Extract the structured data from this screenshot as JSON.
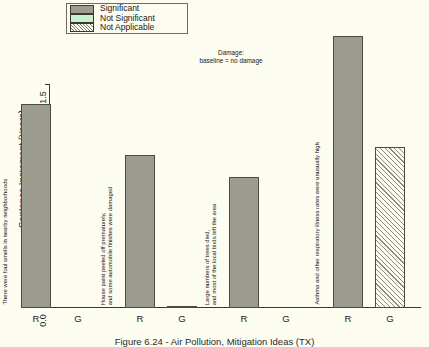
{
  "figure": {
    "caption": "Figure 6.24 - Air Pollution, Mitigation Ideas (TX)",
    "annotation_line1": "Damage:",
    "annotation_line2": "baseline = no damage"
  },
  "legend": {
    "items": [
      {
        "label": "Significant",
        "key": "significant",
        "color": "#9c9c90"
      },
      {
        "label": "Not Significant",
        "key": "notsignificant",
        "color": "#c9f0cf"
      },
      {
        "label": "Not Applicable",
        "key": "notapplicable",
        "color": "#fdfcf0"
      }
    ]
  },
  "chart_data": {
    "type": "bar",
    "title": "Figure 6.24 - Air Pollution, Mitigation Ideas (TX)",
    "xlabel": "",
    "ylabel": "Sentence Increment (Years)",
    "ylim": [
      0.0,
      1.6
    ],
    "yticks": [
      "0.0",
      "0.5",
      "1.0",
      "1.5"
    ],
    "ytick_values": [
      0.0,
      0.5,
      1.0,
      1.5
    ],
    "grid": false,
    "legend_position": "top-center",
    "categories": [
      "R",
      "G",
      "R",
      "G",
      "R",
      "G",
      "R",
      "G"
    ],
    "groups": [
      {
        "caption": "There were foul smells in nearby neighborhoods",
        "bars": [
          {
            "tick": "R",
            "value": 1.37,
            "significance": "significant"
          },
          {
            "tick": "G",
            "value": 0.0,
            "significance": "significant"
          }
        ]
      },
      {
        "caption": "House paint peeled off prematurely, and some automobile finishes were damaged",
        "bars": [
          {
            "tick": "R",
            "value": 1.03,
            "significance": "significant"
          },
          {
            "tick": "G",
            "value": 0.015,
            "significance": "significant"
          }
        ]
      },
      {
        "caption": "Large numbers of trees died, and most of the local birds left the area",
        "bars": [
          {
            "tick": "R",
            "value": 0.88,
            "significance": "significant"
          },
          {
            "tick": "G",
            "value": 0.0,
            "significance": "significant"
          }
        ]
      },
      {
        "caption": "Asthma and other respiratory illness rates were unusually high",
        "bars": [
          {
            "tick": "R",
            "value": 1.83,
            "significance": "significant"
          },
          {
            "tick": "G",
            "value": 1.08,
            "significance": "notapplicable"
          }
        ]
      }
    ]
  }
}
